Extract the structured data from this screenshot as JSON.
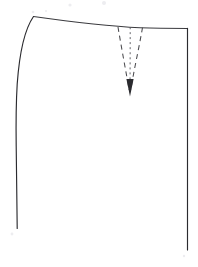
{
  "figure": {
    "background_color": "#ffffff",
    "line_color": "#2b2b2f",
    "dart_color": "#4a4a4e",
    "width": 198,
    "height": 267
  },
  "geometry": {
    "waistline": {
      "label": "waistline",
      "path": "M 33.5 16.5 C 62 20.5 108 26.2 140 27.8 C 158 28.4 176 28.4 187.5 28.4",
      "start_point": [
        33.5,
        16.5
      ],
      "end_point": [
        187.5,
        28.4
      ],
      "note": "curved waist seam, high at side seam, flattening toward centre front"
    },
    "side_seam": {
      "label": "side-seam",
      "path": "M 33.5 16.5 C 25.5 28 19.5 52 17.2 84 C 16.0 104 15.9 124 16.2 146 C 16.6 176 17.0 206 17.2 228.5",
      "start_point": [
        33.5,
        16.5
      ],
      "end_point": [
        17.2,
        228.5
      ],
      "note": "hip curve flaring out from waist then running near-vertical to hem"
    },
    "centre_front": {
      "label": "centre-front-line",
      "path": "M 187.5 28.4 L 187.5 250.0",
      "start_point": [
        187.5,
        28.4
      ],
      "end_point": [
        187.5,
        250.0
      ],
      "note": "straight grain / centre front, extends below side seam end"
    },
    "dart": {
      "label": "waist-dart",
      "apex": [
        130.0,
        92.0
      ],
      "left_leg": {
        "label": "dart-leg-left",
        "path": "M 118.0 27.0 C 121.5 48.0 126.0 72.0 129.2 90.0"
      },
      "centre_fold": {
        "label": "dart-centre-fold",
        "path": "M 130.2 27.3 C 130.2 48.0 130.1 72.0 130.0 90.0"
      },
      "right_leg": {
        "label": "dart-leg-right",
        "path": "M 142.5 27.6 C 139.0 48.0 133.5 72.0 130.8 90.0"
      },
      "arrow_head": {
        "label": "dart-direction-arrow",
        "points": "126.4,79.0 133.6,79.0 130.0,96.5"
      }
    }
  },
  "specks": [
    {
      "cx": 70,
      "cy": 5,
      "r": 1.6
    },
    {
      "cx": 104,
      "cy": 3,
      "r": 2.0
    },
    {
      "cx": 33,
      "cy": 12,
      "r": 1.3
    },
    {
      "cx": 46,
      "cy": 11,
      "r": 1.1
    },
    {
      "cx": 12,
      "cy": 234,
      "r": 1.4
    },
    {
      "cx": 184,
      "cy": 256,
      "r": 1.2
    }
  ]
}
